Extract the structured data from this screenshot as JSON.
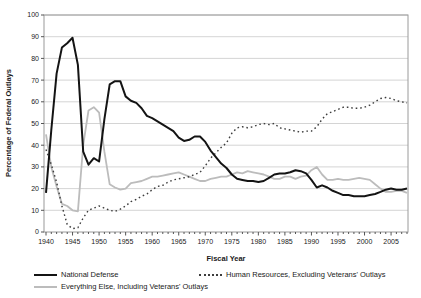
{
  "chart_data": {
    "type": "line",
    "title": "",
    "xlabel": "Fiscal Year",
    "ylabel": "Percentage of Federal Outlays",
    "x_start": 1940,
    "x_end": 2008,
    "ylim": [
      0,
      100
    ],
    "y_ticks": [
      0,
      10,
      20,
      30,
      40,
      50,
      60,
      70,
      80,
      90,
      100
    ],
    "x_tick_labels": [
      1940,
      1945,
      1950,
      1955,
      1960,
      1965,
      1970,
      1975,
      1980,
      1985,
      1990,
      1995,
      2000,
      2005
    ],
    "grid": "horizontal",
    "legend_position": "bottom",
    "series": [
      {
        "name": "National Defense",
        "style": "solid",
        "color": "#141414",
        "width": 2,
        "values": [
          18,
          47,
          73,
          85,
          87,
          89.5,
          77,
          37,
          31,
          34,
          32.5,
          52,
          68,
          69.5,
          69.5,
          62.5,
          60.5,
          59.5,
          57,
          53.5,
          52.5,
          51,
          49.5,
          48,
          46.5,
          43.5,
          42,
          42.5,
          44,
          44,
          41.5,
          37.5,
          34.5,
          31.5,
          29.5,
          26.5,
          24.5,
          24,
          23.5,
          23.5,
          23,
          23.5,
          25,
          26.5,
          27,
          27,
          27.5,
          28.5,
          28,
          27,
          24,
          20.5,
          21.5,
          20.5,
          19,
          18,
          17,
          17,
          16.5,
          16.5,
          16.5,
          17,
          17.5,
          18.5,
          19.5,
          20,
          19.5,
          19.5,
          20
        ]
      },
      {
        "name": "Human Resources, Excluding Veterans' Outlays",
        "style": "dotted",
        "color": "#3d3d3d",
        "width": 1.4,
        "values": [
          38,
          31,
          23,
          12,
          3.5,
          1.5,
          2,
          6.5,
          10,
          11,
          12,
          11,
          10,
          9.5,
          10.5,
          12,
          14,
          15,
          16.5,
          17.5,
          19.5,
          21,
          21.5,
          23,
          24,
          24.5,
          25,
          25.5,
          26.5,
          27.5,
          30.5,
          34,
          36.5,
          39,
          41,
          45.5,
          48,
          48.5,
          48,
          48.5,
          49.5,
          50,
          49.5,
          50,
          48,
          47.5,
          47,
          46.5,
          46,
          46.5,
          46.5,
          48.5,
          52,
          54.5,
          55.5,
          56.5,
          57.5,
          57.5,
          57,
          57,
          57.5,
          58.5,
          60,
          61.5,
          62,
          61.5,
          60.5,
          60,
          59.5
        ]
      },
      {
        "name": "Everything Else, Including Veterans' Outlays",
        "style": "solid",
        "color": "#bcbcbc",
        "width": 1.8,
        "values": [
          45,
          30,
          21,
          13,
          12,
          10,
          9.5,
          40,
          56,
          57.5,
          55,
          37,
          22,
          20.5,
          19.5,
          20,
          22.5,
          23,
          23.5,
          24.5,
          25.5,
          25.5,
          26,
          26.5,
          27,
          27.5,
          26.5,
          25.5,
          24.5,
          23.5,
          23.5,
          24.5,
          25,
          25.5,
          25.5,
          26.5,
          27.5,
          27,
          28,
          27.5,
          27,
          26.5,
          25.5,
          24.5,
          24.5,
          25.5,
          25.5,
          24.5,
          25.5,
          26,
          28.5,
          30,
          26.5,
          24,
          24,
          24.5,
          24,
          24,
          24.5,
          25,
          24.5,
          24,
          22,
          20,
          18.5,
          18.5,
          19,
          19,
          18
        ]
      }
    ]
  },
  "colors": {
    "grid": "#c9c9c9",
    "border": "#9a9a9a",
    "tick_text": "#1a1a1a"
  }
}
